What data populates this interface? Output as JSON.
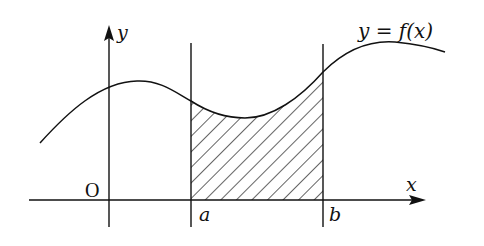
{
  "figure": {
    "type": "area-under-curve diagram",
    "labels": {
      "y_axis": "y",
      "x_axis": "x",
      "origin": "O",
      "a": "a",
      "b": "b",
      "curve": "y = f(x)"
    },
    "colors": {
      "stroke": "#111111",
      "background": "#ffffff"
    },
    "shaded_region": "area between y = f(x), x = a, x = b and the x-axis (hatched)"
  }
}
